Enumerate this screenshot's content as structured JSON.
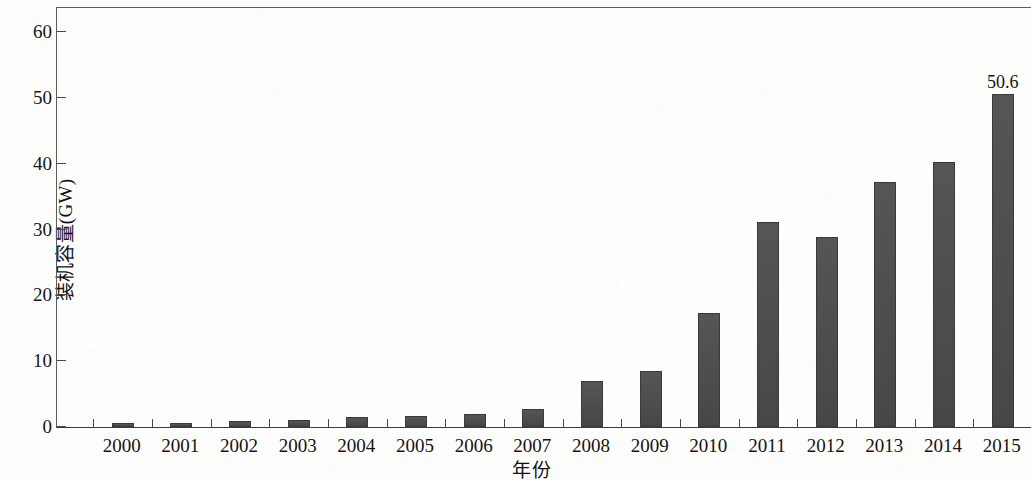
{
  "chart_data": {
    "type": "bar",
    "title": "",
    "xlabel": "年份",
    "ylabel": "装机容量(GW)",
    "categories": [
      "2000",
      "2001",
      "2002",
      "2003",
      "2004",
      "2005",
      "2006",
      "2007",
      "2008",
      "2009",
      "2010",
      "2011",
      "2012",
      "2013",
      "2014",
      "2015"
    ],
    "values": [
      0.6,
      0.6,
      0.9,
      1.0,
      1.5,
      1.7,
      2.0,
      2.8,
      7.0,
      8.5,
      17.3,
      31.2,
      28.9,
      37.2,
      40.3,
      50.6
    ],
    "value_labels": [
      "",
      "",
      "",
      "",
      "",
      "",
      "",
      "",
      "",
      "",
      "",
      "",
      "",
      "",
      "",
      "50.6"
    ],
    "ylim": [
      0,
      64
    ],
    "ytick_values": [
      0,
      10,
      20,
      30,
      40,
      50,
      60
    ],
    "ytick_labels": [
      "0",
      "10",
      "20",
      "30",
      "40",
      "50",
      "60"
    ],
    "grid": false,
    "legend": null,
    "bar_color": "#4b4b4b",
    "axis_color": "#4a4a4a",
    "background_color": "#fdfdfc"
  }
}
